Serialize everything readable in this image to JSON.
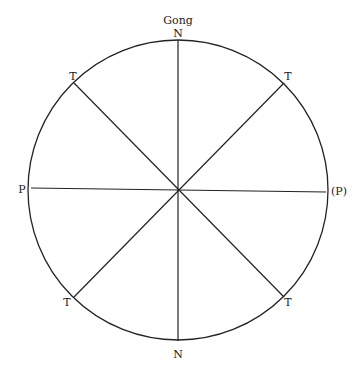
{
  "diagram": {
    "title": "Gong",
    "center": [
      178,
      190
    ],
    "radius": 150,
    "labels": {
      "top": "N",
      "bottom": "N",
      "left": "P",
      "right": "(P)",
      "top_left": "T",
      "top_right": "T",
      "bottom_left": "T",
      "bottom_right": "T"
    },
    "line_color": "#222222"
  }
}
